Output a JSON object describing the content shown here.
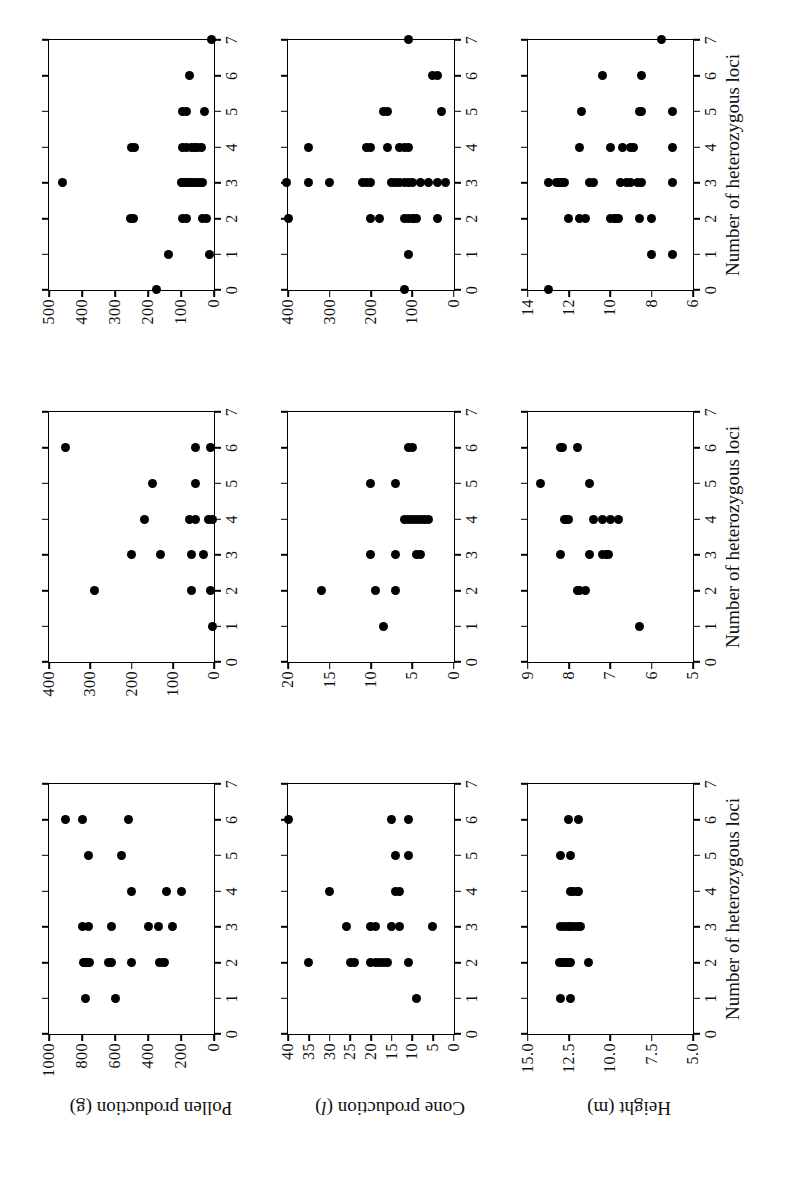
{
  "figure": {
    "type": "scatter-matrix",
    "orientation": "rotated-90-ccw",
    "x_axis_title": "Number of heterozygous loci",
    "row_titles": [
      {
        "text": "Pollen production (g)",
        "plain": "Pollen production",
        "unit": "g",
        "unit_italic": false
      },
      {
        "text": "Cone production (l)",
        "plain": "Cone production",
        "unit": "l",
        "unit_italic": true
      },
      {
        "text": "Height (m)",
        "plain": "Height",
        "unit": "m",
        "unit_italic": false
      }
    ],
    "x_ticks": [
      "0",
      "1",
      "2",
      "3",
      "4",
      "5",
      "6",
      "7"
    ],
    "marker_color": "#000000",
    "axis_color": "#000000",
    "background": "#ffffff"
  },
  "chart_data": [
    {
      "type": "scatter",
      "title": "Pollen production (g) - population 1",
      "row": 0,
      "col": 0,
      "xlabel": "Number of heterozygous loci",
      "ylabel": "Pollen production (g)",
      "xlim": [
        0,
        7
      ],
      "ylim": [
        0,
        1000
      ],
      "xticks": [
        0,
        1,
        2,
        3,
        4,
        5,
        6,
        7
      ],
      "yticks": [
        0,
        200,
        400,
        600,
        800,
        1000
      ],
      "ytick_labels": [
        "0",
        "200",
        "400",
        "600",
        "800",
        "1000"
      ],
      "grid": false,
      "points": [
        [
          1,
          780
        ],
        [
          1,
          600
        ],
        [
          2,
          790
        ],
        [
          2,
          785
        ],
        [
          2,
          775
        ],
        [
          2,
          765
        ],
        [
          2,
          755
        ],
        [
          2,
          640
        ],
        [
          2,
          620
        ],
        [
          2,
          500
        ],
        [
          2,
          330
        ],
        [
          2,
          310
        ],
        [
          2,
          300
        ],
        [
          3,
          800
        ],
        [
          3,
          760
        ],
        [
          3,
          620
        ],
        [
          3,
          400
        ],
        [
          3,
          340
        ],
        [
          3,
          250
        ],
        [
          4,
          500
        ],
        [
          4,
          290
        ],
        [
          4,
          200
        ],
        [
          5,
          760
        ],
        [
          5,
          560
        ],
        [
          6,
          900
        ],
        [
          6,
          800
        ],
        [
          6,
          520
        ]
      ]
    },
    {
      "type": "scatter",
      "title": "Pollen production (g) - population 2",
      "row": 0,
      "col": 1,
      "xlabel": "Number of heterozygous loci",
      "ylabel": "Pollen production (g)",
      "xlim": [
        0,
        7
      ],
      "ylim": [
        0,
        400
      ],
      "xticks": [
        0,
        1,
        2,
        3,
        4,
        5,
        6,
        7
      ],
      "yticks": [
        0,
        100,
        200,
        300,
        400
      ],
      "ytick_labels": [
        "0",
        "100",
        "200",
        "300",
        "400"
      ],
      "grid": false,
      "points": [
        [
          1,
          5
        ],
        [
          2,
          290
        ],
        [
          2,
          55
        ],
        [
          2,
          10
        ],
        [
          3,
          200
        ],
        [
          3,
          130
        ],
        [
          3,
          55
        ],
        [
          3,
          25
        ],
        [
          4,
          170
        ],
        [
          4,
          60
        ],
        [
          4,
          45
        ],
        [
          4,
          15
        ],
        [
          4,
          5
        ],
        [
          5,
          150
        ],
        [
          5,
          45
        ],
        [
          6,
          360
        ],
        [
          6,
          45
        ],
        [
          6,
          10
        ]
      ]
    },
    {
      "type": "scatter",
      "title": "Pollen production (g) - population 3",
      "row": 0,
      "col": 2,
      "xlabel": "Number of heterozygous loci",
      "ylabel": "Pollen production (g)",
      "xlim": [
        0,
        7
      ],
      "ylim": [
        0,
        500
      ],
      "xticks": [
        0,
        1,
        2,
        3,
        4,
        5,
        6,
        7
      ],
      "yticks": [
        0,
        100,
        200,
        300,
        400,
        500
      ],
      "ytick_labels": [
        "0",
        "100",
        "200",
        "300",
        "400",
        "500"
      ],
      "grid": false,
      "points": [
        [
          0,
          175
        ],
        [
          1,
          140
        ],
        [
          1,
          15
        ],
        [
          2,
          255
        ],
        [
          2,
          245
        ],
        [
          2,
          95
        ],
        [
          2,
          85
        ],
        [
          2,
          35
        ],
        [
          2,
          25
        ],
        [
          3,
          460
        ],
        [
          3,
          100
        ],
        [
          3,
          95
        ],
        [
          3,
          88
        ],
        [
          3,
          80
        ],
        [
          3,
          72
        ],
        [
          3,
          62
        ],
        [
          3,
          55
        ],
        [
          3,
          45
        ],
        [
          3,
          35
        ],
        [
          4,
          250
        ],
        [
          4,
          240
        ],
        [
          4,
          95
        ],
        [
          4,
          85
        ],
        [
          4,
          70
        ],
        [
          4,
          60
        ],
        [
          4,
          50
        ],
        [
          4,
          40
        ],
        [
          5,
          95
        ],
        [
          5,
          85
        ],
        [
          5,
          30
        ],
        [
          6,
          75
        ],
        [
          7,
          8
        ]
      ]
    },
    {
      "type": "scatter",
      "title": "Cone production (l) - population 1",
      "row": 1,
      "col": 0,
      "xlabel": "Number of heterozygous loci",
      "ylabel": "Cone production (l)",
      "xlim": [
        0,
        7
      ],
      "ylim": [
        0,
        40
      ],
      "xticks": [
        0,
        1,
        2,
        3,
        4,
        5,
        6,
        7
      ],
      "yticks": [
        0,
        5,
        10,
        15,
        20,
        25,
        30,
        35,
        40
      ],
      "ytick_labels": [
        "0",
        "5",
        "10",
        "15",
        "20",
        "25",
        "30",
        "35",
        "40"
      ],
      "grid": false,
      "points": [
        [
          1,
          9
        ],
        [
          2,
          35
        ],
        [
          2,
          25
        ],
        [
          2,
          24
        ],
        [
          2,
          20
        ],
        [
          2,
          19
        ],
        [
          2,
          18
        ],
        [
          2,
          17
        ],
        [
          2,
          16
        ],
        [
          2,
          11
        ],
        [
          3,
          26
        ],
        [
          3,
          20
        ],
        [
          3,
          19
        ],
        [
          3,
          15
        ],
        [
          3,
          13
        ],
        [
          3,
          5
        ],
        [
          4,
          30
        ],
        [
          4,
          14
        ],
        [
          4,
          13
        ],
        [
          5,
          14
        ],
        [
          5,
          11
        ],
        [
          6,
          40
        ],
        [
          6,
          15
        ],
        [
          6,
          11
        ]
      ]
    },
    {
      "type": "scatter",
      "title": "Cone production (l) - population 2",
      "row": 1,
      "col": 1,
      "xlabel": "Number of heterozygous loci",
      "ylabel": "Cone production (l)",
      "xlim": [
        0,
        7
      ],
      "ylim": [
        0,
        20
      ],
      "xticks": [
        0,
        1,
        2,
        3,
        4,
        5,
        6,
        7
      ],
      "yticks": [
        0,
        5,
        10,
        15,
        20
      ],
      "ytick_labels": [
        "0",
        "5",
        "10",
        "15",
        "20"
      ],
      "grid": false,
      "points": [
        [
          1,
          8.5
        ],
        [
          2,
          16
        ],
        [
          2,
          9.5
        ],
        [
          2,
          7
        ],
        [
          3,
          10
        ],
        [
          3,
          7
        ],
        [
          3,
          4.5
        ],
        [
          3,
          4
        ],
        [
          4,
          6
        ],
        [
          4,
          5.5
        ],
        [
          4,
          5
        ],
        [
          4,
          4.5
        ],
        [
          4,
          4
        ],
        [
          4,
          3.5
        ],
        [
          4,
          3
        ],
        [
          5,
          10
        ],
        [
          5,
          7
        ],
        [
          6,
          5.5
        ],
        [
          6,
          5
        ]
      ]
    },
    {
      "type": "scatter",
      "title": "Cone production (l) - population 3",
      "row": 1,
      "col": 2,
      "xlabel": "Number of heterozygous loci",
      "ylabel": "Cone production (l)",
      "xlim": [
        0,
        7
      ],
      "ylim": [
        0,
        400
      ],
      "xticks": [
        0,
        1,
        2,
        3,
        4,
        5,
        6,
        7
      ],
      "yticks": [
        0,
        100,
        200,
        300,
        400
      ],
      "ytick_labels": [
        "0",
        "100",
        "200",
        "300",
        "400"
      ],
      "grid": false,
      "points": [
        [
          0,
          120
        ],
        [
          1,
          110
        ],
        [
          2,
          400
        ],
        [
          2,
          200
        ],
        [
          2,
          180
        ],
        [
          2,
          120
        ],
        [
          2,
          110
        ],
        [
          2,
          100
        ],
        [
          2,
          95
        ],
        [
          2,
          90
        ],
        [
          2,
          40
        ],
        [
          3,
          410
        ],
        [
          3,
          350
        ],
        [
          3,
          300
        ],
        [
          3,
          220
        ],
        [
          3,
          210
        ],
        [
          3,
          200
        ],
        [
          3,
          150
        ],
        [
          3,
          140
        ],
        [
          3,
          130
        ],
        [
          3,
          120
        ],
        [
          3,
          110
        ],
        [
          3,
          100
        ],
        [
          3,
          80
        ],
        [
          3,
          60
        ],
        [
          3,
          40
        ],
        [
          3,
          20
        ],
        [
          4,
          350
        ],
        [
          4,
          210
        ],
        [
          4,
          200
        ],
        [
          4,
          160
        ],
        [
          4,
          130
        ],
        [
          4,
          120
        ],
        [
          4,
          110
        ],
        [
          5,
          170
        ],
        [
          5,
          160
        ],
        [
          5,
          30
        ],
        [
          6,
          50
        ],
        [
          6,
          40
        ],
        [
          7,
          110
        ]
      ]
    },
    {
      "type": "scatter",
      "title": "Height (m) - population 1",
      "row": 2,
      "col": 0,
      "xlabel": "Number of heterozygous loci",
      "ylabel": "Height (m)",
      "xlim": [
        0,
        7
      ],
      "ylim": [
        5.0,
        15.0
      ],
      "xticks": [
        0,
        1,
        2,
        3,
        4,
        5,
        6,
        7
      ],
      "yticks": [
        5.0,
        7.5,
        10.0,
        12.5,
        15.0
      ],
      "ytick_labels": [
        "5.0",
        "7.5",
        "10.0",
        "12.5",
        "15.0"
      ],
      "grid": false,
      "points": [
        [
          1,
          13.0
        ],
        [
          1,
          12.4
        ],
        [
          2,
          13.1
        ],
        [
          2,
          12.9
        ],
        [
          2,
          12.8
        ],
        [
          2,
          12.7
        ],
        [
          2,
          12.6
        ],
        [
          2,
          12.5
        ],
        [
          2,
          12.4
        ],
        [
          2,
          11.3
        ],
        [
          3,
          13.0
        ],
        [
          3,
          12.8
        ],
        [
          3,
          12.5
        ],
        [
          3,
          12.4
        ],
        [
          3,
          12.2
        ],
        [
          3,
          12.0
        ],
        [
          3,
          11.8
        ],
        [
          4,
          12.4
        ],
        [
          4,
          12.2
        ],
        [
          4,
          12.0
        ],
        [
          4,
          11.9
        ],
        [
          5,
          13.0
        ],
        [
          5,
          12.4
        ],
        [
          6,
          12.5
        ],
        [
          6,
          11.9
        ]
      ]
    },
    {
      "type": "scatter",
      "title": "Height (m) - population 2",
      "row": 2,
      "col": 1,
      "xlabel": "Number of heterozygous loci",
      "ylabel": "Height (m)",
      "xlim": [
        0,
        7
      ],
      "ylim": [
        5,
        9
      ],
      "xticks": [
        0,
        1,
        2,
        3,
        4,
        5,
        6,
        7
      ],
      "yticks": [
        5,
        6,
        7,
        8,
        9
      ],
      "ytick_labels": [
        "5",
        "6",
        "7",
        "8",
        "9"
      ],
      "grid": false,
      "points": [
        [
          1,
          6.3
        ],
        [
          2,
          7.8
        ],
        [
          2,
          7.75
        ],
        [
          2,
          7.6
        ],
        [
          3,
          8.2
        ],
        [
          3,
          7.5
        ],
        [
          3,
          7.2
        ],
        [
          3,
          7.1
        ],
        [
          3,
          7.05
        ],
        [
          4,
          8.1
        ],
        [
          4,
          8.05
        ],
        [
          4,
          8.0
        ],
        [
          4,
          7.4
        ],
        [
          4,
          7.2
        ],
        [
          4,
          7.0
        ],
        [
          4,
          6.8
        ],
        [
          5,
          8.7
        ],
        [
          5,
          7.5
        ],
        [
          6,
          8.2
        ],
        [
          6,
          8.15
        ],
        [
          6,
          7.8
        ]
      ]
    },
    {
      "type": "scatter",
      "title": "Height (m) - population 3",
      "row": 2,
      "col": 2,
      "xlabel": "Number of heterozygous loci",
      "ylabel": "Height (m)",
      "xlim": [
        6,
        14
      ],
      "ylim": [
        6,
        14
      ],
      "xticks": [
        0,
        1,
        2,
        3,
        4,
        5,
        6,
        7
      ],
      "yticks": [
        6,
        8,
        10,
        12,
        14
      ],
      "ytick_labels": [
        "6",
        "8",
        "10",
        "12",
        "14"
      ],
      "grid": false,
      "points": [
        [
          0,
          13.0
        ],
        [
          1,
          8.0
        ],
        [
          1,
          7.0
        ],
        [
          2,
          12.0
        ],
        [
          2,
          11.5
        ],
        [
          2,
          11.2
        ],
        [
          2,
          10.0
        ],
        [
          2,
          9.8
        ],
        [
          2,
          9.7
        ],
        [
          2,
          9.6
        ],
        [
          2,
          8.6
        ],
        [
          2,
          8.0
        ],
        [
          3,
          13.0
        ],
        [
          3,
          12.6
        ],
        [
          3,
          12.5
        ],
        [
          3,
          12.4
        ],
        [
          3,
          12.3
        ],
        [
          3,
          12.2
        ],
        [
          3,
          11.0
        ],
        [
          3,
          10.8
        ],
        [
          3,
          9.5
        ],
        [
          3,
          9.2
        ],
        [
          3,
          9.0
        ],
        [
          3,
          8.7
        ],
        [
          3,
          8.5
        ],
        [
          3,
          7.0
        ],
        [
          4,
          11.5
        ],
        [
          4,
          10.0
        ],
        [
          4,
          9.4
        ],
        [
          4,
          9.0
        ],
        [
          4,
          8.9
        ],
        [
          4,
          7.0
        ],
        [
          5,
          11.4
        ],
        [
          5,
          8.6
        ],
        [
          5,
          8.5
        ],
        [
          5,
          7.0
        ],
        [
          6,
          10.4
        ],
        [
          6,
          8.5
        ],
        [
          7,
          7.5
        ]
      ]
    }
  ]
}
